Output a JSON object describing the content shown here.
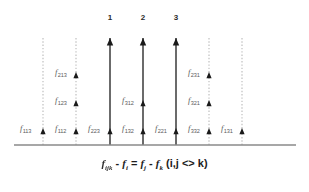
{
  "figure": {
    "type": "spectral-line-diagram",
    "background_color": "#ffffff",
    "baseline": {
      "color": "#8a8a8a",
      "y": 145,
      "x_start": 14,
      "x_end": 296
    },
    "colors": {
      "principal_line": "#3a3a3a",
      "guide_line": "#b9b9b9",
      "arrowhead": "#1a1a1a",
      "label_text": "#5a5a5a",
      "number_text": "#2b2b2b",
      "equation_text": "#1d1d1d"
    },
    "top_markers": [
      {
        "label": "1",
        "x": 110
      },
      {
        "label": "2",
        "x": 143
      },
      {
        "label": "3",
        "x": 176
      }
    ],
    "lines": [
      {
        "id": "line-1",
        "x": 43,
        "style": "dotted",
        "principal": false,
        "top_y": 38,
        "arrows": [
          {
            "label_base": "f",
            "label_sub": "113",
            "y": 128,
            "label_x": 20,
            "label_y": 124
          }
        ]
      },
      {
        "id": "line-2",
        "x": 76,
        "style": "dotted",
        "principal": false,
        "top_y": 38,
        "arrows": [
          {
            "label_base": "f",
            "label_sub": "213",
            "y": 72,
            "label_x": 55,
            "label_y": 68
          },
          {
            "label_base": "f",
            "label_sub": "123",
            "y": 100,
            "label_x": 55,
            "label_y": 96
          },
          {
            "label_base": "f",
            "label_sub": "112",
            "y": 128,
            "label_x": 55,
            "label_y": 124
          }
        ]
      },
      {
        "id": "line-3",
        "x": 110,
        "style": "solid",
        "principal": true,
        "top_y": 38,
        "arrows": [
          {
            "label_base": "f",
            "label_sub": "223",
            "y": 128,
            "label_x": 88,
            "label_y": 124
          }
        ]
      },
      {
        "id": "line-4",
        "x": 143,
        "style": "solid",
        "principal": true,
        "top_y": 38,
        "arrows": [
          {
            "label_base": "f",
            "label_sub": "312",
            "y": 100,
            "label_x": 122,
            "label_y": 96
          },
          {
            "label_base": "f",
            "label_sub": "132",
            "y": 128,
            "label_x": 122,
            "label_y": 124
          }
        ]
      },
      {
        "id": "line-5",
        "x": 176,
        "style": "solid",
        "principal": true,
        "top_y": 38,
        "arrows": [
          {
            "label_base": "f",
            "label_sub": "221",
            "y": 128,
            "label_x": 155,
            "label_y": 124
          }
        ]
      },
      {
        "id": "line-6",
        "x": 209,
        "style": "dotted",
        "principal": false,
        "top_y": 38,
        "arrows": [
          {
            "label_base": "f",
            "label_sub": "231",
            "y": 72,
            "label_x": 188,
            "label_y": 68
          },
          {
            "label_base": "f",
            "label_sub": "321",
            "y": 100,
            "label_x": 188,
            "label_y": 96
          },
          {
            "label_base": "f",
            "label_sub": "332",
            "y": 128,
            "label_x": 188,
            "label_y": 124
          }
        ]
      },
      {
        "id": "line-7",
        "x": 242,
        "style": "dotted",
        "principal": false,
        "top_y": 38,
        "arrows": [
          {
            "label_base": "f",
            "label_sub": "131",
            "y": 128,
            "label_x": 221,
            "label_y": 124
          }
        ]
      }
    ],
    "equation": {
      "term1_base": "f",
      "term1_sub": "ijk",
      "op1": " - ",
      "term2_base": "f",
      "term2_sub": "i",
      "op2": " = ",
      "term3_base": "f",
      "term3_sub": "j",
      "op3": " - ",
      "term4_base": "f",
      "term4_sub": "k",
      "condition": " (i,j <> k)",
      "plain": "f_ijk - f_i = f_j - f_k  (i,j <> k)"
    }
  }
}
